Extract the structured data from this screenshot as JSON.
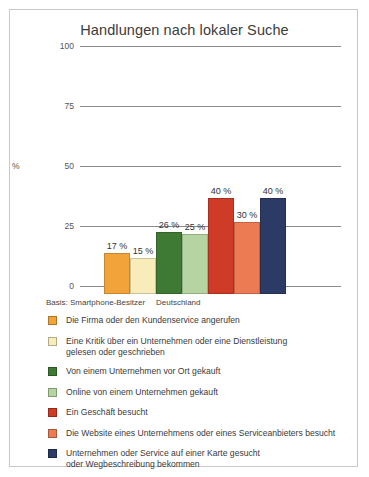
{
  "chart_data": {
    "type": "bar",
    "title": "Handlungen nach lokaler Suche",
    "xlabel": "",
    "ylabel": "%",
    "ylim": [
      0,
      100
    ],
    "yticks": [
      "0",
      "25",
      "50",
      "75",
      "100"
    ],
    "grid": true,
    "legend_position": "bottom",
    "categories": [
      "Die Firma oder den Kundenservice angerufen",
      "Eine Kritik über ein Unternehmen oder eine Dienstleistung gelesen oder geschrieben",
      "Von einem Unternehmen vor Ort gekauft",
      "Online von einem Unternehmen gekauft",
      "Ein Geschäft besucht",
      "Die Website eines Unternehmens oder eines Serviceanbieters besucht",
      "Unternehmen oder Service auf einer Karte gesucht oder Wegbeschreibung bekommen"
    ],
    "values": [
      17,
      15,
      26,
      25,
      40,
      30,
      40
    ],
    "value_labels": [
      "17 %",
      "15 %",
      "26 %",
      "25 %",
      "40 %",
      "30 %",
      "40 %"
    ],
    "colors": [
      "#F2A43A",
      "#F8EDBA",
      "#3E7A33",
      "#B5D4A2",
      "#CE3B26",
      "#EC7B53",
      "#2C3A66"
    ],
    "annotations": {
      "basis": "Basis: Smartphone-Besitzer",
      "region": "Deutschland"
    }
  },
  "legend": {
    "entries": [
      {
        "label": "Die Firma oder den Kundenservice angerufen",
        "color": "#F2A43A"
      },
      {
        "label": "Eine Kritik über ein Unternehmen oder eine Dienstleistung\ngelesen oder geschrieben",
        "color": "#F8EDBA"
      },
      {
        "label": "Von einem Unternehmen vor Ort gekauft",
        "color": "#3E7A33"
      },
      {
        "label": "Online von einem Unternehmen gekauft",
        "color": "#B5D4A2"
      },
      {
        "label": "Ein Geschäft besucht",
        "color": "#CE3B26"
      },
      {
        "label": "Die Website eines Unternehmens oder eines Serviceanbieters besucht",
        "color": "#EC7B53"
      },
      {
        "label": "Unternehmen oder Service auf einer Karte gesucht\noder Wegbeschreibung bekommen",
        "color": "#2C3A66"
      }
    ]
  }
}
